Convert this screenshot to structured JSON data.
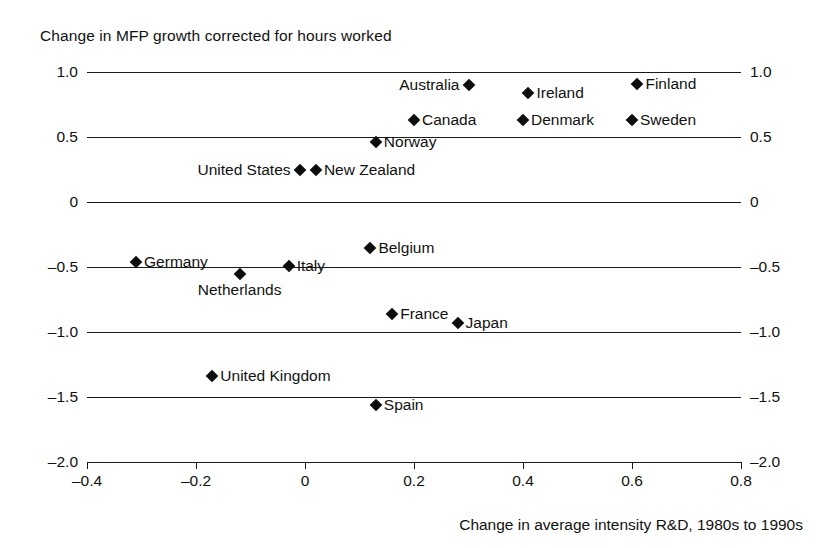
{
  "chart_data": {
    "type": "scatter",
    "title": "Change in MFP growth corrected for hours worked",
    "xlabel": "Change in average intensity R&D, 1980s to 1990s",
    "ylabel": "",
    "xlim": [
      -0.4,
      0.8
    ],
    "ylim": [
      -2.0,
      1.0
    ],
    "grid": true,
    "gridlines_y": [
      1.0,
      0.5,
      0,
      -0.5,
      -1.0,
      -1.5,
      -2.0
    ],
    "y_ticks": [
      "1.0",
      "0.5",
      "0",
      "-0.5",
      "-1.0",
      "-1.5",
      "-2.0"
    ],
    "y_ticks_right": [
      "1.0",
      "0.5",
      "0",
      "-0.5",
      "-1.0",
      "-1.5",
      "-2.0"
    ],
    "x_ticks": [
      "-0.4",
      "-0.2",
      "0",
      "0.2",
      "0.4",
      "0.6",
      "0.8"
    ],
    "x_tick_values": [
      -0.4,
      -0.2,
      0,
      0.2,
      0.4,
      0.6,
      0.8
    ],
    "marker_color": "#0d0d0d",
    "marker_shape": "diamond",
    "legend": "none",
    "points": [
      {
        "label": "Australia",
        "x": 0.3,
        "y": 0.9,
        "label_side": "left"
      },
      {
        "label": "Ireland",
        "x": 0.41,
        "y": 0.84,
        "label_side": "right"
      },
      {
        "label": "Finland",
        "x": 0.61,
        "y": 0.91,
        "label_side": "right"
      },
      {
        "label": "Canada",
        "x": 0.2,
        "y": 0.63,
        "label_side": "right"
      },
      {
        "label": "Denmark",
        "x": 0.4,
        "y": 0.63,
        "label_side": "right"
      },
      {
        "label": "Sweden",
        "x": 0.6,
        "y": 0.63,
        "label_side": "right"
      },
      {
        "label": "Norway",
        "x": 0.13,
        "y": 0.46,
        "label_side": "right"
      },
      {
        "label": "United States",
        "x": -0.01,
        "y": 0.25,
        "label_side": "left"
      },
      {
        "label": "New Zealand",
        "x": 0.02,
        "y": 0.25,
        "label_side": "right"
      },
      {
        "label": "Belgium",
        "x": 0.12,
        "y": -0.35,
        "label_side": "right"
      },
      {
        "label": "Germany",
        "x": -0.31,
        "y": -0.46,
        "label_side": "right"
      },
      {
        "label": "Italy",
        "x": -0.03,
        "y": -0.49,
        "label_side": "right"
      },
      {
        "label": "Netherlands",
        "x": -0.12,
        "y": -0.55,
        "label_side": "below"
      },
      {
        "label": "France",
        "x": 0.16,
        "y": -0.86,
        "label_side": "right"
      },
      {
        "label": "Japan",
        "x": 0.28,
        "y": -0.93,
        "label_side": "right"
      },
      {
        "label": "United Kingdom",
        "x": -0.17,
        "y": -1.34,
        "label_side": "right"
      },
      {
        "label": "Spain",
        "x": 0.13,
        "y": -1.56,
        "label_side": "right"
      }
    ]
  }
}
